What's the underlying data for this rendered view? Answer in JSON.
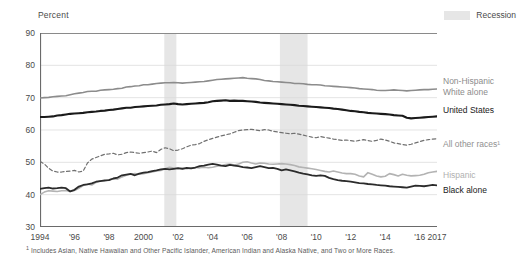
{
  "axis_title": "Percent",
  "legend": {
    "recession_label": "Recession",
    "recession_color": "#e6e6e6"
  },
  "footnote_marker": "1",
  "footnote": " Includes Asian, Native Hawaiian and Other Pacific Islander, American Indian and Alaska Native, and Two or More Races.",
  "series_labels": {
    "nhwhite_line1": "Non-Hispanic",
    "nhwhite_line2": "White alone",
    "us": "United States",
    "allother": "All other races¹",
    "hispanic": "Hispanic",
    "black": "Black alone"
  },
  "chart_data": {
    "type": "line",
    "title": "",
    "xlabel": "",
    "ylabel": "Percent",
    "ylim": [
      30,
      90
    ],
    "ytick_values": [
      30,
      40,
      50,
      60,
      70,
      80,
      90
    ],
    "ytick_labels": [
      "30",
      "40",
      "50",
      "60",
      "70",
      "80",
      "90"
    ],
    "xlim": [
      1994,
      2017
    ],
    "xtick_values": [
      1994,
      1996,
      1998,
      2000,
      2002,
      2004,
      2006,
      2008,
      2010,
      2012,
      2014,
      2016,
      2017
    ],
    "xtick_labels": [
      "1994",
      "'96",
      "'98",
      "2000",
      "'02",
      "'04",
      "'06",
      "'08",
      "'10",
      "'12",
      "'14",
      "'16",
      "2017"
    ],
    "grid": "horizontal",
    "legend_position": "right-of-plot",
    "shaded_regions": [
      {
        "label": "Recession",
        "start": 2001.2,
        "end": 2001.9,
        "color": "#e6e6e6"
      },
      {
        "label": "Recession",
        "start": 2007.9,
        "end": 2009.5,
        "color": "#e6e6e6"
      }
    ],
    "x": [
      1994,
      1994.25,
      1994.5,
      1994.75,
      1995,
      1995.25,
      1995.5,
      1995.75,
      1996,
      1996.25,
      1996.5,
      1996.75,
      1997,
      1997.25,
      1997.5,
      1997.75,
      1998,
      1998.25,
      1998.5,
      1998.75,
      1999,
      1999.25,
      1999.5,
      1999.75,
      2000,
      2000.25,
      2000.5,
      2000.75,
      2001,
      2001.25,
      2001.5,
      2001.75,
      2002,
      2002.25,
      2002.5,
      2002.75,
      2003,
      2003.25,
      2003.5,
      2003.75,
      2004,
      2004.25,
      2004.5,
      2004.75,
      2005,
      2005.25,
      2005.5,
      2005.75,
      2006,
      2006.25,
      2006.5,
      2006.75,
      2007,
      2007.25,
      2007.5,
      2007.75,
      2008,
      2008.25,
      2008.5,
      2008.75,
      2009,
      2009.25,
      2009.5,
      2009.75,
      2010,
      2010.25,
      2010.5,
      2010.75,
      2011,
      2011.25,
      2011.5,
      2011.75,
      2012,
      2012.25,
      2012.5,
      2012.75,
      2013,
      2013.25,
      2013.5,
      2013.75,
      2014,
      2014.25,
      2014.5,
      2014.75,
      2015,
      2015.25,
      2015.5,
      2015.75,
      2016,
      2016.25,
      2016.5,
      2016.75,
      2017
    ],
    "series": [
      {
        "name": "Non-Hispanic White alone",
        "color": "#8c8c8c",
        "style": "solid",
        "values": [
          69.9,
          70.0,
          70.1,
          70.3,
          70.4,
          70.5,
          70.6,
          70.9,
          71.2,
          71.4,
          71.6,
          71.9,
          72.0,
          72.0,
          72.3,
          72.4,
          72.5,
          72.6,
          72.8,
          72.9,
          73.3,
          73.4,
          73.6,
          73.7,
          74.0,
          74.0,
          74.2,
          74.4,
          74.5,
          74.6,
          74.6,
          74.7,
          74.6,
          74.5,
          74.6,
          74.7,
          74.8,
          74.9,
          75.0,
          75.2,
          75.4,
          75.6,
          75.7,
          75.8,
          75.9,
          76.0,
          76.1,
          76.2,
          76.0,
          75.9,
          75.8,
          75.6,
          75.3,
          75.2,
          75.0,
          74.9,
          74.8,
          74.7,
          74.6,
          74.4,
          74.4,
          74.3,
          74.1,
          74.0,
          74.0,
          73.9,
          73.7,
          73.6,
          73.5,
          73.4,
          73.3,
          73.2,
          73.1,
          73.0,
          72.8,
          72.7,
          72.6,
          72.5,
          72.3,
          72.2,
          72.2,
          72.3,
          72.4,
          72.3,
          72.2,
          72.1,
          72.2,
          72.3,
          72.4,
          72.5,
          72.5,
          72.6,
          72.7
        ]
      },
      {
        "name": "United States",
        "color": "#1a1a1a",
        "style": "solid",
        "values": [
          64.0,
          64.0,
          64.1,
          64.2,
          64.5,
          64.6,
          64.8,
          65.0,
          65.1,
          65.2,
          65.3,
          65.5,
          65.6,
          65.7,
          65.9,
          66.0,
          66.2,
          66.3,
          66.5,
          66.7,
          66.9,
          66.9,
          67.1,
          67.2,
          67.3,
          67.4,
          67.5,
          67.6,
          67.8,
          67.9,
          68.0,
          68.2,
          68.0,
          67.9,
          68.0,
          68.1,
          68.2,
          68.3,
          68.4,
          68.6,
          68.9,
          69.0,
          69.1,
          69.2,
          69.0,
          69.1,
          69.0,
          69.0,
          68.9,
          68.8,
          68.7,
          68.5,
          68.4,
          68.3,
          68.2,
          68.1,
          68.0,
          67.9,
          67.8,
          67.7,
          67.5,
          67.4,
          67.3,
          67.2,
          67.1,
          67.0,
          66.9,
          66.8,
          66.6,
          66.5,
          66.3,
          66.1,
          65.9,
          65.8,
          65.6,
          65.5,
          65.3,
          65.2,
          65.1,
          65.0,
          64.9,
          64.8,
          64.6,
          64.5,
          64.4,
          63.8,
          63.6,
          63.7,
          63.8,
          63.9,
          64.0,
          64.1,
          64.2
        ]
      },
      {
        "name": "All other races",
        "color": "#707070",
        "style": "dashed",
        "values": [
          50.3,
          49.5,
          48.2,
          47.3,
          47.0,
          47.0,
          47.2,
          47.3,
          47.5,
          47.0,
          47.3,
          49.8,
          51.0,
          51.5,
          52.0,
          52.5,
          52.6,
          52.8,
          52.3,
          52.5,
          53.0,
          53.2,
          53.0,
          52.8,
          53.0,
          53.2,
          53.5,
          53.0,
          54.0,
          54.5,
          54.2,
          53.6,
          53.8,
          54.2,
          54.8,
          55.3,
          55.5,
          55.8,
          56.5,
          57.0,
          57.4,
          57.8,
          58.2,
          58.5,
          58.8,
          59.3,
          59.8,
          60.0,
          60.1,
          60.2,
          60.0,
          59.8,
          60.1,
          60.0,
          59.6,
          59.4,
          59.2,
          59.0,
          58.8,
          59.0,
          58.7,
          58.4,
          58.1,
          57.8,
          57.6,
          58.0,
          57.7,
          57.5,
          57.2,
          57.0,
          56.8,
          56.9,
          56.7,
          56.5,
          56.8,
          57.0,
          56.7,
          56.5,
          56.8,
          57.2,
          56.9,
          56.5,
          56.0,
          55.8,
          55.5,
          55.3,
          55.6,
          56.0,
          56.4,
          56.8,
          57.0,
          57.2,
          57.3
        ]
      },
      {
        "name": "Hispanic",
        "color": "#b3b3b3",
        "style": "solid",
        "values": [
          40.0,
          40.8,
          41.2,
          41.1,
          41.0,
          41.2,
          41.3,
          41.0,
          41.3,
          42.0,
          42.8,
          43.3,
          43.0,
          43.8,
          44.3,
          44.2,
          44.6,
          45.0,
          44.8,
          45.5,
          46.0,
          46.3,
          46.5,
          46.3,
          46.5,
          46.8,
          47.0,
          47.3,
          47.5,
          48.0,
          48.5,
          48.2,
          48.0,
          48.2,
          48.0,
          48.2,
          48.4,
          48.3,
          48.5,
          48.3,
          48.5,
          48.8,
          49.0,
          49.3,
          49.5,
          49.2,
          49.5,
          50.0,
          50.2,
          49.8,
          49.5,
          49.8,
          49.7,
          49.5,
          49.4,
          49.5,
          49.6,
          49.5,
          49.3,
          49.0,
          48.6,
          48.4,
          48.2,
          48.0,
          47.8,
          47.5,
          47.2,
          47.0,
          47.3,
          47.0,
          46.7,
          46.5,
          46.5,
          46.3,
          45.8,
          45.5,
          46.8,
          46.3,
          45.8,
          45.5,
          45.7,
          46.5,
          46.2,
          45.8,
          46.3,
          46.0,
          45.8,
          45.9,
          46.0,
          46.3,
          46.8,
          47.0,
          47.2
        ]
      },
      {
        "name": "Black alone",
        "color": "#2b2b2b",
        "style": "solid",
        "values": [
          41.8,
          42.0,
          42.2,
          41.9,
          42.0,
          42.2,
          42.0,
          41.0,
          41.5,
          42.5,
          43.0,
          43.2,
          43.5,
          44.0,
          44.2,
          44.4,
          44.5,
          45.0,
          45.3,
          46.0,
          46.2,
          46.4,
          46.0,
          46.5,
          46.8,
          47.0,
          47.3,
          47.5,
          47.8,
          48.0,
          47.8,
          48.0,
          48.2,
          48.0,
          48.3,
          48.1,
          48.4,
          48.8,
          49.0,
          49.3,
          49.5,
          49.3,
          49.0,
          48.8,
          49.2,
          49.0,
          48.8,
          48.5,
          48.4,
          48.2,
          48.5,
          48.8,
          48.5,
          48.2,
          48.3,
          48.0,
          47.5,
          47.8,
          47.5,
          47.2,
          46.8,
          46.5,
          46.3,
          46.0,
          45.8,
          46.0,
          45.8,
          45.2,
          44.8,
          44.5,
          44.3,
          44.2,
          44.0,
          43.8,
          43.6,
          43.5,
          43.3,
          43.2,
          43.0,
          42.9,
          42.8,
          42.6,
          42.5,
          42.4,
          42.3,
          42.2,
          42.5,
          42.8,
          42.7,
          42.6,
          42.8,
          43.0,
          42.9
        ]
      }
    ]
  }
}
